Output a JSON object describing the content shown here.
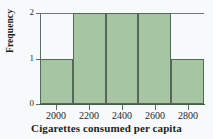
{
  "chart_data": {
    "type": "bar",
    "title": "",
    "subtitle": "",
    "xlabel": "Cigarettes consumed per capita",
    "ylabel": "Frequency",
    "categories": [
      "1900-2100",
      "2100-2300",
      "2300-2500",
      "2500-2700",
      "2700-2900"
    ],
    "bin_edges": [
      1900,
      2100,
      2300,
      2500,
      2700,
      2900
    ],
    "bin_width": 200,
    "values": [
      1,
      2,
      2,
      2,
      1
    ],
    "x": [
      2000,
      2200,
      2400,
      2600,
      2800
    ],
    "xlim": [
      1900,
      2900
    ],
    "ylim": [
      0,
      2
    ],
    "x_ticks": [
      "2000",
      "2200",
      "2400",
      "2600",
      "2800"
    ],
    "y_ticks": [
      "0",
      "1",
      "2"
    ],
    "grid": false,
    "legend": null,
    "legend_position": "none",
    "bar_color": "#a6c6a3",
    "bar_edge_color": "#53685a",
    "axis_color": "#5d6d65",
    "background_color": "#f7fafb",
    "text_color": "#1d1f22"
  }
}
